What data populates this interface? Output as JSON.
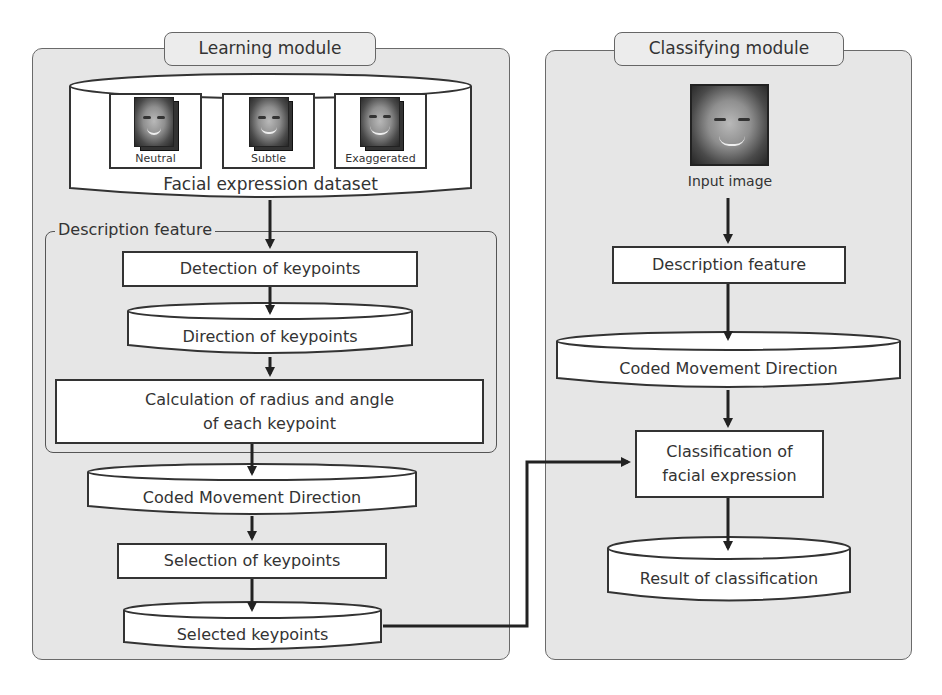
{
  "learning_module": {
    "title": "Learning module",
    "dataset": {
      "label": "Facial expression dataset",
      "samples": [
        {
          "label": "Neutral",
          "icon": "face-image-icon"
        },
        {
          "label": "Subtle",
          "icon": "face-image-icon"
        },
        {
          "label": "Exaggerated",
          "icon": "face-image-icon"
        }
      ]
    },
    "description_feature": {
      "group_label": "Description feature",
      "steps": {
        "detection": "Detection of keypoints",
        "direction": "Direction of keypoints",
        "calculation_line1": "Calculation of radius and angle",
        "calculation_line2": "of each keypoint"
      }
    },
    "coded_movement": "Coded Movement Direction",
    "selection": "Selection of keypoints",
    "selected": "Selected keypoints"
  },
  "classifying_module": {
    "title": "Classifying module",
    "input_image_label": "Input image",
    "description_feature": "Description feature",
    "coded_movement": "Coded Movement Direction",
    "classification_line1": "Classification of",
    "classification_line2": "facial expression",
    "result": "Result of classification"
  },
  "colors": {
    "panel_bg": "#e6e6e6",
    "node_fill": "#ffffff",
    "stroke": "#333333"
  }
}
